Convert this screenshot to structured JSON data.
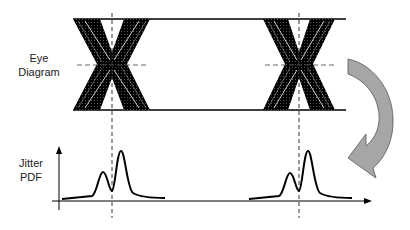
{
  "labels": {
    "eye_line1": "Eye",
    "eye_line2": "Diagram",
    "jitter_line1": "Jitter",
    "jitter_line2": "PDF"
  },
  "colors": {
    "ink": "#000000",
    "arrow_fill": "#a6a6a6",
    "arrow_stroke": "#555555"
  },
  "diagram": {
    "eye_crossings": [
      {
        "center_x": 112,
        "left": 73,
        "right": 150
      },
      {
        "center_x": 299,
        "left": 263,
        "right": 335
      }
    ],
    "jitter_pdfs": [
      {
        "center_x": 112,
        "small_peak": {
          "x": 103,
          "y": 172
        },
        "tall_peak": {
          "x": 121,
          "y": 151
        }
      },
      {
        "center_x": 299,
        "small_peak": {
          "x": 290,
          "y": 173
        },
        "tall_peak": {
          "x": 308,
          "y": 151
        }
      }
    ]
  }
}
